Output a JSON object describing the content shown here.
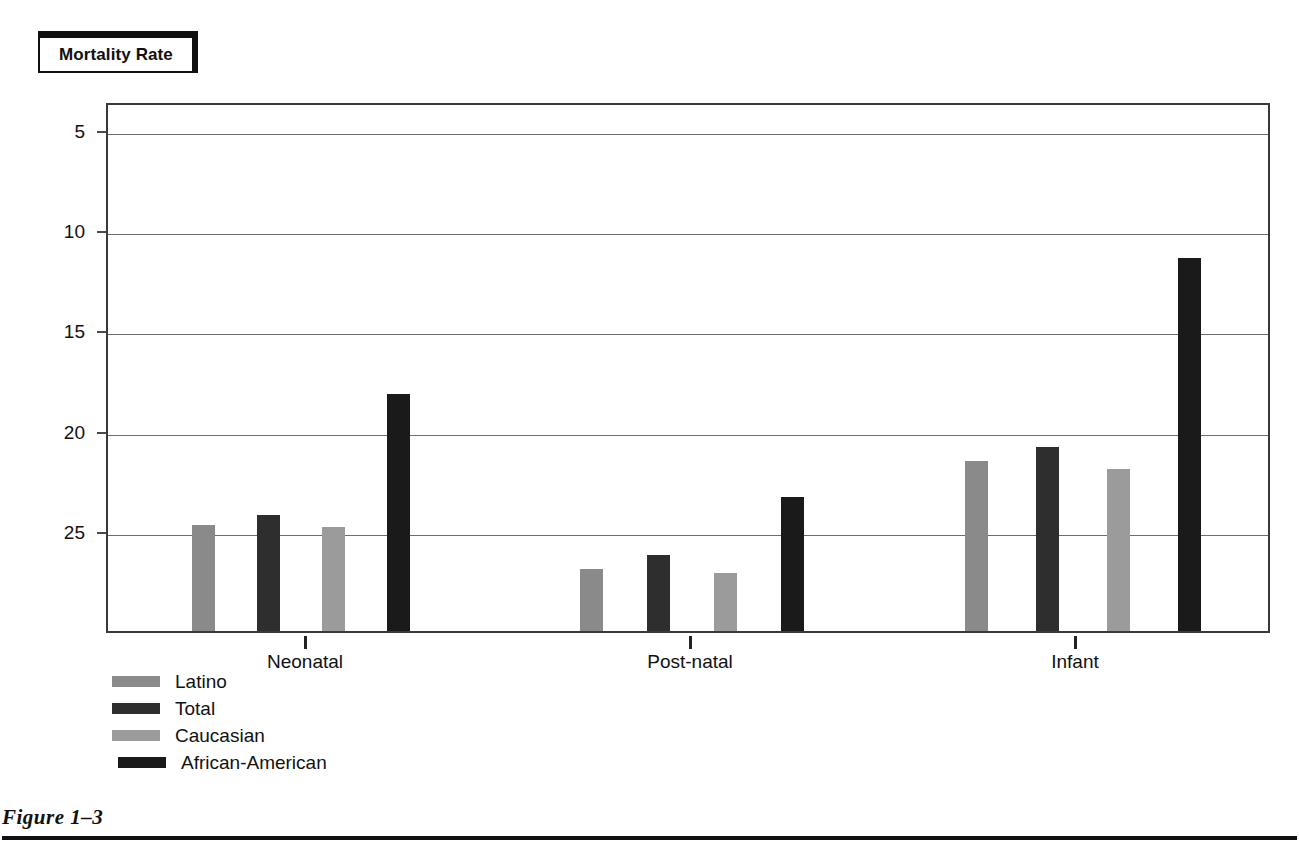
{
  "title": {
    "text": "Mortality Rate"
  },
  "figure": {
    "caption": "Figure 1–3"
  },
  "axis": {
    "y_ticks": [
      "25",
      "20",
      "15",
      "10",
      "5"
    ],
    "x_categories": [
      "Neonatal",
      "Post-natal",
      "Infant"
    ]
  },
  "legend": {
    "entries": [
      {
        "label": "Latino",
        "color": "#8a8a8a"
      },
      {
        "label": "Total",
        "color": "#2e2e2e"
      },
      {
        "label": "Caucasian",
        "color": "#9b9b9b"
      },
      {
        "label": "African-American",
        "color": "#1a1a1a"
      }
    ]
  },
  "chart_data": {
    "type": "bar",
    "title": "Mortality Rate",
    "xlabel": "",
    "ylabel": "Mortality Rate",
    "ylim": [
      0,
      26.5
    ],
    "yticks": [
      5,
      10,
      15,
      20,
      25
    ],
    "grid": true,
    "legend_position": "below-left",
    "categories": [
      "Neonatal",
      "Post-natal",
      "Infant"
    ],
    "series": [
      {
        "name": "Latino",
        "color": "#8a8a8a",
        "values": [
          5.3,
          3.1,
          8.5
        ]
      },
      {
        "name": "Total",
        "color": "#2e2e2e",
        "values": [
          5.8,
          3.8,
          9.2
        ]
      },
      {
        "name": "Caucasian",
        "color": "#9b9b9b",
        "values": [
          5.2,
          2.9,
          8.1
        ]
      },
      {
        "name": "African-American",
        "color": "#1a1a1a",
        "values": [
          11.8,
          6.7,
          18.6
        ]
      }
    ]
  }
}
